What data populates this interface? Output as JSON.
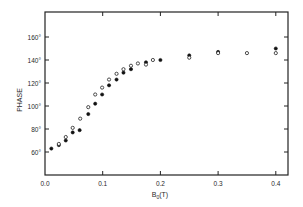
{
  "chart_data": {
    "type": "scatter",
    "title": "",
    "xlabel": "B0(T)",
    "xlabel_main": "B",
    "xlabel_sub": "0",
    "xlabel_unit": "(T)",
    "ylabel": "PHASE",
    "xlim": [
      0.0,
      0.42
    ],
    "ylim": [
      40,
      182
    ],
    "x_ticks": [
      {
        "value": 0.0,
        "label": "0.0"
      },
      {
        "value": 0.1,
        "label": "0.1"
      },
      {
        "value": 0.2,
        "label": "0.2"
      },
      {
        "value": 0.3,
        "label": "0.3"
      },
      {
        "value": 0.4,
        "label": "0.4"
      }
    ],
    "y_ticks": [
      {
        "value": 60,
        "label": "60°"
      },
      {
        "value": 80,
        "label": "80°"
      },
      {
        "value": 100,
        "label": "100°"
      },
      {
        "value": 120,
        "label": "120°"
      },
      {
        "value": 140,
        "label": "140°"
      },
      {
        "value": 160,
        "label": "160°"
      }
    ],
    "grid": false,
    "legend": null,
    "series": [
      {
        "name": "filled",
        "marker": "filled-circle",
        "points": [
          [
            0.011,
            63
          ],
          [
            0.024,
            66
          ],
          [
            0.036,
            70
          ],
          [
            0.048,
            77
          ],
          [
            0.06,
            79
          ],
          [
            0.075,
            93
          ],
          [
            0.087,
            102
          ],
          [
            0.099,
            110
          ],
          [
            0.111,
            118
          ],
          [
            0.124,
            123
          ],
          [
            0.136,
            129
          ],
          [
            0.149,
            132
          ],
          [
            0.175,
            138
          ],
          [
            0.2,
            140
          ],
          [
            0.25,
            144
          ],
          [
            0.3,
            147
          ],
          [
            0.4,
            150
          ]
        ]
      },
      {
        "name": "open",
        "marker": "open-circle",
        "points": [
          [
            0.024,
            67
          ],
          [
            0.036,
            73
          ],
          [
            0.048,
            81
          ],
          [
            0.061,
            89
          ],
          [
            0.075,
            99
          ],
          [
            0.087,
            110
          ],
          [
            0.099,
            116
          ],
          [
            0.111,
            123
          ],
          [
            0.124,
            128
          ],
          [
            0.136,
            132
          ],
          [
            0.149,
            135
          ],
          [
            0.161,
            137
          ],
          [
            0.175,
            136
          ],
          [
            0.187,
            140
          ],
          [
            0.25,
            142
          ],
          [
            0.3,
            146
          ],
          [
            0.35,
            146
          ],
          [
            0.4,
            146
          ]
        ]
      }
    ]
  }
}
